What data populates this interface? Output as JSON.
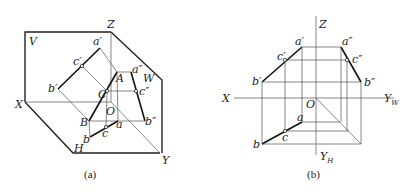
{
  "figures": [
    {
      "id": "a",
      "caption": "(a)",
      "description": "Pictorial (3D) view of projection planes V, H, W with line AB and point C projected",
      "plane_labels": {
        "V": "V",
        "H": "H",
        "W": "W"
      },
      "axis_labels": {
        "X": "X",
        "Y": "Y",
        "Z": "Z",
        "O": "O"
      },
      "space_points": {
        "A": "A",
        "B": "B",
        "C": "C"
      },
      "v_projections": {
        "a": "a′",
        "b": "b′",
        "c": "c′"
      },
      "h_projections": {
        "a": "a",
        "b": "b",
        "c": "c"
      },
      "w_projections": {
        "a": "a″",
        "b": "b″",
        "c": "c″"
      }
    },
    {
      "id": "b",
      "caption": "(b)",
      "description": "Orthographic three-view projection diagram of line AB with point C",
      "axis_labels": {
        "X": "X",
        "Z": "Z",
        "O": "O",
        "YW": "Y",
        "YW_sub": "W",
        "YH": "Y",
        "YH_sub": "H"
      },
      "v_projections": {
        "a": "a′",
        "b": "b′",
        "c": "c′"
      },
      "h_projections": {
        "a": "a",
        "b": "b",
        "c": "c"
      },
      "w_projections": {
        "a": "a″",
        "b": "b″",
        "c": "c″"
      }
    }
  ]
}
